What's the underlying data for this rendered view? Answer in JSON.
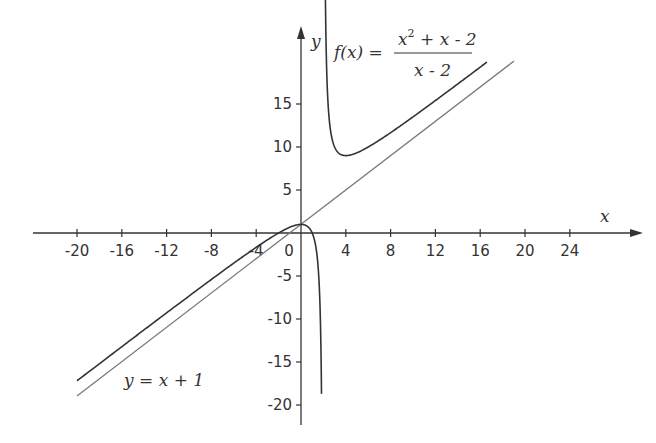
{
  "chart_data": {
    "type": "line",
    "title": "",
    "xlabel": "x",
    "ylabel": "y",
    "xlim": [
      -24,
      28
    ],
    "ylim": [
      -22,
      23
    ],
    "grid": false,
    "x_ticks": [
      -20,
      -16,
      -12,
      -8,
      -4,
      0,
      4,
      8,
      12,
      16,
      20,
      24
    ],
    "x_tick_labels": [
      "-20",
      "-16",
      "-12",
      "-8",
      "-4",
      "0",
      "4",
      "8",
      "12",
      "16",
      "20",
      "24"
    ],
    "y_ticks": [
      15,
      10,
      5,
      -5,
      -10,
      -15,
      -20
    ],
    "y_tick_labels": [
      "15",
      "10",
      "5",
      "-5",
      "-10",
      "-15",
      "-20"
    ],
    "series": [
      {
        "name": "f(x) = (x^2 + x - 2)/(x - 2)",
        "color": "#333333",
        "branches": [
          {
            "domain": [
              -20,
              1.83
            ],
            "points": [
              [
                -20,
                -17.18
              ],
              [
                -10,
                -7.5
              ],
              [
                -4,
                -1.67
              ],
              [
                0,
                1
              ],
              [
                1,
                0
              ],
              [
                1.5,
                -3.5
              ],
              [
                1.8,
                -14.8
              ],
              [
                1.83,
                -22.3
              ]
            ]
          },
          {
            "domain": [
              2.1,
              16.6
            ],
            "points": [
              [
                2.1,
                23.1
              ],
              [
                2.5,
                12.5
              ],
              [
                3,
                10
              ],
              [
                4,
                9
              ],
              [
                5,
                9.33
              ],
              [
                8,
                11.67
              ],
              [
                12,
                14.6
              ],
              [
                16.6,
                19.88
              ]
            ]
          }
        ]
      },
      {
        "name": "y = x + 1",
        "color": "#777777",
        "points": [
          [
            -20,
            -19
          ],
          [
            19,
            20
          ]
        ]
      }
    ],
    "annotations": [
      {
        "text": "f(x) = (x² + x - 2)/(x - 2)",
        "position": "top-center"
      },
      {
        "text": "y = x + 1",
        "position": "bottom-left"
      }
    ]
  },
  "labels": {
    "x_axis": "x",
    "y_axis": "y",
    "f_lhs": "f(x) =",
    "f_num_x": "x",
    "f_num_exp": "2",
    "f_num_rest": " + x - 2",
    "f_den": "x - 2",
    "asym": "y = x + 1"
  }
}
